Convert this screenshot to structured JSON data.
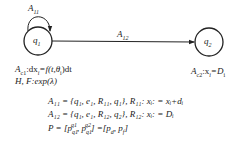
{
  "states": [
    {
      "id": "q1",
      "label": "q",
      "sub": "1"
    },
    {
      "id": "q2",
      "label": "q",
      "sub": "2"
    }
  ],
  "transitions": {
    "self_loop": {
      "label": "A",
      "sub": "11"
    },
    "q1_to_q2": {
      "label": "A",
      "sub": "12"
    }
  },
  "state_annotations": {
    "q1": {
      "a": "A",
      "sub": "c1",
      "rest": ":dx",
      "rest_sub": "i",
      "eq": "=f(t,θ",
      "eq_sub": "i",
      "tail": ")dt"
    },
    "q1_line2": "H, F:exp(λ)",
    "q2": {
      "a": "A",
      "sub": "c2",
      "rest": ":x",
      "rest_sub": "i",
      "eq": "=D",
      "eq_sub": "i"
    }
  },
  "equations": [
    "A₁₁ = {q₁, e₁, R₁₁, q₁}, R₁₁: xᵢ: = xᵢ+dᵢ",
    "A₁₂ = {q₁, e₁, R₁₂, q₂},  R₁₂: xᵢ: = Dᵢ",
    "P = [p_q1^q1, p_q1^q2] =[p_d, p_f]"
  ],
  "colors": {
    "stroke": "#222222",
    "background": "#ffffff"
  }
}
